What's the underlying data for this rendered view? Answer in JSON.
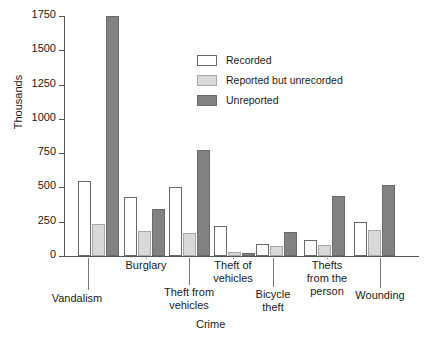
{
  "chart_data": {
    "type": "bar",
    "title": "",
    "xlabel": "Crime",
    "ylabel": "Thousands",
    "ylim": [
      0,
      1750
    ],
    "yticks": [
      0,
      250,
      500,
      750,
      1000,
      1250,
      1500,
      1750
    ],
    "ytick_labels": [
      "0",
      "250",
      "500",
      "750",
      "1000",
      "1250",
      "1500",
      "1750"
    ],
    "grid": false,
    "legend_position": "upper-center",
    "categories": [
      "Vandalism",
      "Burglary",
      "Theft from\nvehicles",
      "Theft of\nvehicles",
      "Bicycle\ntheft",
      "Thefts\nfrom the\nperson",
      "Wounding"
    ],
    "series": [
      {
        "name": "Recorded",
        "color": "#ffffff",
        "values": [
          550,
          430,
          500,
          220,
          90,
          120,
          245
        ]
      },
      {
        "name": "Reported but unrecorded",
        "color": "#d9d9d9",
        "values": [
          230,
          180,
          165,
          30,
          75,
          80,
          190
        ]
      },
      {
        "name": "Unreported",
        "color": "#828282",
        "values": [
          1750,
          340,
          775,
          25,
          175,
          440,
          520
        ]
      }
    ]
  },
  "legend": {
    "items": [
      {
        "label": "Recorded",
        "swatch": "recorded"
      },
      {
        "label": "Reported but unrecorded",
        "swatch": "unrecorded"
      },
      {
        "label": "Unreported",
        "swatch": "unreported"
      }
    ]
  },
  "axes": {
    "y_title": "Thousands",
    "x_title": "Crime"
  },
  "category_labels": [
    {
      "text": "Vandalism",
      "left": 32,
      "top": 292,
      "width": 90,
      "leader_x": 88,
      "leader_top": 258,
      "leader_height": 32
    },
    {
      "text": "Burglary",
      "left": 101,
      "top": 259,
      "width": 90,
      "leader_x": 146,
      "leader_top": 258,
      "leader_height": 1
    },
    {
      "text": "Theft from\nvehicles",
      "left": 144,
      "top": 286,
      "width": 90,
      "leader_x": 189,
      "leader_top": 258,
      "leader_height": 27
    },
    {
      "text": "Theft of\nvehicles",
      "left": 188,
      "top": 259,
      "width": 90,
      "leader_x": 233,
      "leader_top": 258,
      "leader_height": 1
    },
    {
      "text": "Bicycle\ntheft",
      "left": 233,
      "top": 288,
      "width": 80,
      "leader_x": 273,
      "leader_top": 258,
      "leader_height": 29
    },
    {
      "text": "Thefts\nfrom the\nperson",
      "left": 282,
      "top": 259,
      "width": 90,
      "leader_x": 327,
      "leader_top": 258,
      "leader_height": 1
    },
    {
      "text": "Wounding",
      "left": 330,
      "top": 289,
      "width": 100,
      "leader_x": 380,
      "leader_top": 258,
      "leader_height": 30
    }
  ]
}
